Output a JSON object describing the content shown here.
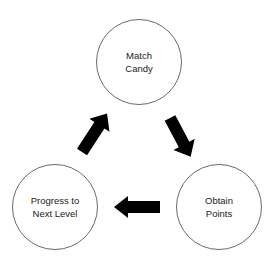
{
  "diagram": {
    "type": "cycle",
    "nodes": [
      {
        "id": "match",
        "label": "Match\nCandy"
      },
      {
        "id": "obtain",
        "label": "Obtain\nPoints"
      },
      {
        "id": "progress",
        "label": "Progress to\nNext Level"
      }
    ],
    "edges": [
      {
        "from": "match",
        "to": "obtain",
        "direction": "down-right"
      },
      {
        "from": "obtain",
        "to": "progress",
        "direction": "left"
      },
      {
        "from": "progress",
        "to": "match",
        "direction": "up-right"
      }
    ],
    "colors": {
      "node_border": "#6a6a6a",
      "arrow_fill": "#000000",
      "text": "#222222",
      "background": "#ffffff"
    }
  }
}
